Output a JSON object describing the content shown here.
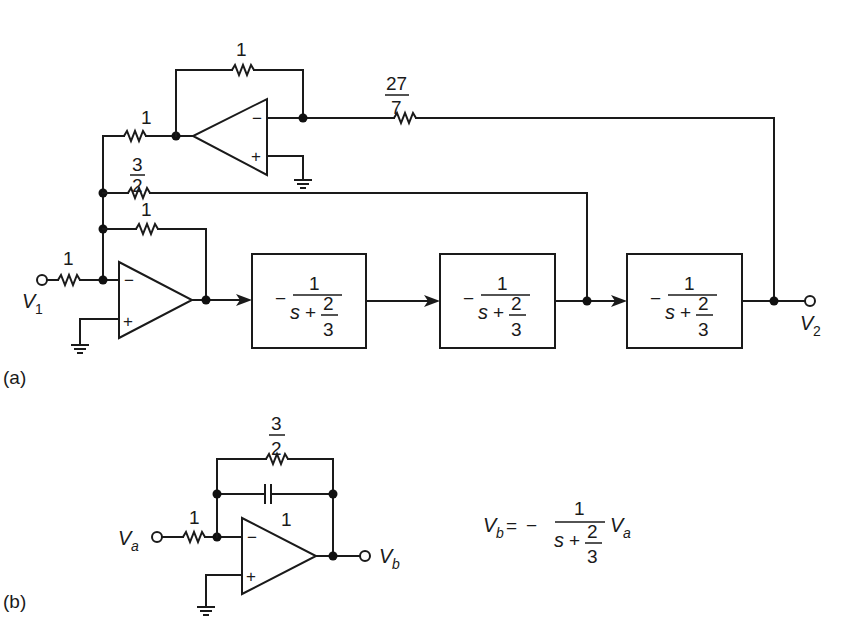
{
  "figure": {
    "part_a": {
      "label": "(a)",
      "input": {
        "name": "V",
        "sub": "1"
      },
      "output": {
        "name": "V",
        "sub": "2"
      },
      "resistors": {
        "input": "1",
        "main_feedback": "1",
        "three_halves": {
          "num": "3",
          "den": "2"
        },
        "inverter_input": "1",
        "inverter_feedback": "1",
        "output_feedback": {
          "num": "27",
          "den": "7"
        }
      },
      "opamp_pins": {
        "minus": "−",
        "plus": "+"
      },
      "blocks": [
        {
          "sign": "−",
          "num": "1",
          "den_var": "s",
          "den_op": "+",
          "den_frac_num": "2",
          "den_frac_den": "3"
        },
        {
          "sign": "−",
          "num": "1",
          "den_var": "s",
          "den_op": "+",
          "den_frac_num": "2",
          "den_frac_den": "3"
        },
        {
          "sign": "−",
          "num": "1",
          "den_var": "s",
          "den_op": "+",
          "den_frac_num": "2",
          "den_frac_den": "3"
        }
      ]
    },
    "part_b": {
      "label": "(b)",
      "input": {
        "name": "V",
        "sub": "a"
      },
      "output": {
        "name": "V",
        "sub": "b"
      },
      "resistors": {
        "input": "1",
        "feedback": {
          "num": "3",
          "den": "2"
        }
      },
      "capacitor": "1",
      "opamp_pins": {
        "minus": "−",
        "plus": "+"
      },
      "equation": {
        "lhs_name": "V",
        "lhs_sub": "b",
        "equals": "=",
        "sign": "−",
        "num": "1",
        "den_var": "s",
        "den_op": "+",
        "den_frac_num": "2",
        "den_frac_den": "3",
        "rhs_name": "V",
        "rhs_sub": "a"
      }
    }
  }
}
